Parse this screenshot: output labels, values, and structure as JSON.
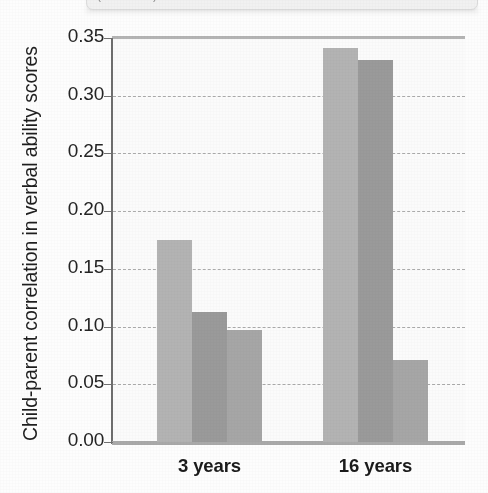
{
  "caption": {
    "text": "(continued)"
  },
  "chart_data": {
    "type": "bar",
    "title": "",
    "xlabel": "",
    "ylabel": "Child-parent correlation in verbal ability scores",
    "categories": [
      "3 years",
      "16 years"
    ],
    "series": [
      {
        "name": "series-1",
        "color": "#b3b3b3",
        "values": [
          0.175,
          0.341
        ]
      },
      {
        "name": "series-2",
        "color": "#9a9a9a",
        "values": [
          0.113,
          0.331
        ]
      },
      {
        "name": "series-3",
        "color": "#a6a6a6",
        "values": [
          0.097,
          0.071
        ]
      }
    ],
    "ylim": [
      0.0,
      0.35
    ],
    "ytick_labels": [
      "0.35",
      "0.30",
      "0.25",
      "0.20",
      "0.15",
      "0.10",
      "0.05",
      "0.00"
    ],
    "ytick_values": [
      0.35,
      0.3,
      0.25,
      0.2,
      0.15,
      0.1,
      0.05,
      0.0
    ],
    "grid": true,
    "grid_style": "dashed-horizontal",
    "legend": "none",
    "background": "#fbfbfb",
    "axis_color": "#6e6e6e"
  }
}
